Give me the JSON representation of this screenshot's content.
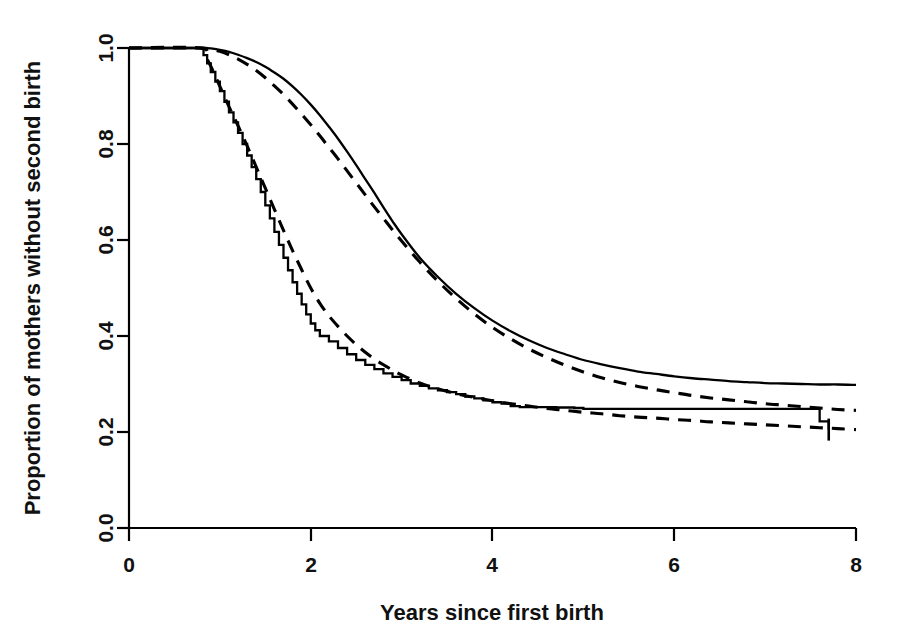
{
  "figure": {
    "background_color": "#ffffff",
    "line_color": "#000000"
  },
  "axes": {
    "x_title": "Years since first birth",
    "y_title": "Proportion of mothers without second birth",
    "x_ticks": [
      "0",
      "2",
      "4",
      "6",
      "8"
    ],
    "y_ticks": [
      "0.0",
      "0.2",
      "0.4",
      "0.6",
      "0.8",
      "1.0"
    ]
  },
  "chart_data": {
    "type": "line",
    "title": "",
    "xlabel": "Years since first birth",
    "ylabel": "Proportion of mothers without second birth",
    "xlim": [
      0,
      8
    ],
    "ylim": [
      0.0,
      1.0
    ],
    "xticks": [
      0,
      2,
      4,
      6,
      8
    ],
    "yticks": [
      0.0,
      0.2,
      0.4,
      0.6,
      0.8,
      1.0
    ],
    "grid": false,
    "legend": "none",
    "series": [
      {
        "name": "Group 1 observed (solid, upper)",
        "style": "solid",
        "x": [
          0.0,
          0.6,
          0.8,
          0.9,
          1.0,
          1.1,
          1.2,
          1.3,
          1.4,
          1.5,
          1.6,
          1.7,
          1.8,
          1.9,
          2.0,
          2.1,
          2.2,
          2.3,
          2.4,
          2.5,
          2.6,
          2.7,
          2.8,
          2.9,
          3.0,
          3.2,
          3.4,
          3.6,
          3.8,
          4.0,
          4.2,
          4.4,
          4.6,
          4.8,
          5.0,
          5.2,
          5.4,
          5.6,
          5.8,
          6.0,
          6.2,
          6.4,
          6.6,
          6.8,
          7.0,
          7.2,
          7.4,
          7.6,
          7.8,
          8.0
        ],
        "y": [
          1.0,
          1.0,
          1.0,
          0.999,
          0.996,
          0.992,
          0.986,
          0.979,
          0.971,
          0.961,
          0.949,
          0.936,
          0.92,
          0.902,
          0.882,
          0.86,
          0.836,
          0.811,
          0.784,
          0.756,
          0.727,
          0.698,
          0.668,
          0.639,
          0.612,
          0.563,
          0.523,
          0.488,
          0.458,
          0.432,
          0.41,
          0.391,
          0.375,
          0.362,
          0.35,
          0.341,
          0.333,
          0.326,
          0.321,
          0.316,
          0.312,
          0.309,
          0.306,
          0.304,
          0.302,
          0.301,
          0.3,
          0.299,
          0.299,
          0.298
        ]
      },
      {
        "name": "Group 1 fitted (dashed, upper)",
        "style": "dashed",
        "x": [
          0.0,
          0.6,
          0.8,
          0.9,
          1.0,
          1.1,
          1.2,
          1.3,
          1.4,
          1.5,
          1.6,
          1.7,
          1.8,
          1.9,
          2.0,
          2.1,
          2.2,
          2.3,
          2.4,
          2.5,
          2.6,
          2.7,
          2.8,
          2.9,
          3.0,
          3.2,
          3.4,
          3.6,
          3.8,
          4.0,
          4.2,
          4.4,
          4.6,
          4.8,
          5.0,
          5.2,
          5.4,
          5.6,
          5.8,
          6.0,
          6.2,
          6.4,
          6.6,
          6.8,
          7.0,
          7.2,
          7.4,
          7.6,
          7.8,
          8.0
        ],
        "y": [
          1.0,
          1.0,
          1.0,
          0.998,
          0.993,
          0.986,
          0.977,
          0.966,
          0.953,
          0.938,
          0.921,
          0.903,
          0.883,
          0.862,
          0.84,
          0.817,
          0.793,
          0.769,
          0.744,
          0.719,
          0.694,
          0.669,
          0.645,
          0.621,
          0.598,
          0.554,
          0.514,
          0.478,
          0.446,
          0.418,
          0.394,
          0.373,
          0.355,
          0.339,
          0.325,
          0.313,
          0.303,
          0.295,
          0.288,
          0.282,
          0.276,
          0.271,
          0.267,
          0.263,
          0.259,
          0.256,
          0.253,
          0.25,
          0.247,
          0.245
        ]
      },
      {
        "name": "Group 2 observed (solid step, lower)",
        "style": "solid-step",
        "x": [
          0.0,
          0.78,
          0.82,
          0.86,
          0.9,
          0.95,
          1.0,
          1.05,
          1.1,
          1.15,
          1.2,
          1.25,
          1.3,
          1.35,
          1.4,
          1.45,
          1.5,
          1.55,
          1.6,
          1.65,
          1.7,
          1.75,
          1.8,
          1.85,
          1.9,
          1.95,
          2.0,
          2.05,
          2.1,
          2.2,
          2.3,
          2.4,
          2.5,
          2.6,
          2.7,
          2.8,
          2.9,
          3.0,
          3.1,
          3.2,
          3.3,
          3.4,
          3.5,
          3.6,
          3.7,
          3.8,
          3.9,
          4.0,
          4.1,
          4.2,
          4.3,
          4.5,
          4.7,
          4.9,
          5.0,
          5.5,
          6.0,
          6.5,
          7.0,
          7.5,
          7.6,
          7.7
        ],
        "y": [
          1.0,
          1.0,
          0.985,
          0.968,
          0.95,
          0.93,
          0.91,
          0.888,
          0.866,
          0.845,
          0.823,
          0.8,
          0.776,
          0.752,
          0.727,
          0.7,
          0.672,
          0.645,
          0.617,
          0.59,
          0.563,
          0.537,
          0.512,
          0.488,
          0.466,
          0.445,
          0.426,
          0.412,
          0.4,
          0.389,
          0.375,
          0.362,
          0.35,
          0.34,
          0.331,
          0.322,
          0.315,
          0.308,
          0.301,
          0.296,
          0.291,
          0.287,
          0.283,
          0.279,
          0.274,
          0.27,
          0.266,
          0.262,
          0.259,
          0.254,
          0.252,
          0.252,
          0.251,
          0.25,
          0.248,
          0.248,
          0.248,
          0.248,
          0.248,
          0.248,
          0.222,
          0.205
        ]
      },
      {
        "name": "Group 2 fitted (dashed, lower)",
        "style": "dashed",
        "x": [
          0.0,
          0.78,
          0.85,
          0.9,
          1.0,
          1.1,
          1.2,
          1.3,
          1.4,
          1.5,
          1.6,
          1.7,
          1.8,
          1.9,
          2.0,
          2.1,
          2.2,
          2.3,
          2.4,
          2.5,
          2.6,
          2.7,
          2.8,
          2.9,
          3.0,
          3.2,
          3.4,
          3.6,
          3.8,
          4.0,
          4.2,
          4.4,
          4.6,
          4.8,
          5.0,
          5.2,
          5.4,
          5.6,
          5.8,
          6.0,
          6.2,
          6.4,
          6.6,
          6.8,
          7.0,
          7.2,
          7.4,
          7.6,
          7.8,
          8.0
        ],
        "y": [
          1.0,
          1.0,
          0.98,
          0.962,
          0.92,
          0.878,
          0.838,
          0.796,
          0.752,
          0.708,
          0.664,
          0.62,
          0.578,
          0.538,
          0.5,
          0.468,
          0.442,
          0.42,
          0.4,
          0.382,
          0.366,
          0.352,
          0.34,
          0.329,
          0.319,
          0.302,
          0.29,
          0.28,
          0.272,
          0.265,
          0.259,
          0.254,
          0.249,
          0.245,
          0.241,
          0.238,
          0.234,
          0.231,
          0.229,
          0.226,
          0.224,
          0.221,
          0.219,
          0.217,
          0.215,
          0.213,
          0.211,
          0.209,
          0.207,
          0.205
        ]
      }
    ],
    "annotations": [
      {
        "name": "censoring-tick",
        "x": 7.7,
        "y": 0.205,
        "symbol": "|"
      }
    ]
  }
}
